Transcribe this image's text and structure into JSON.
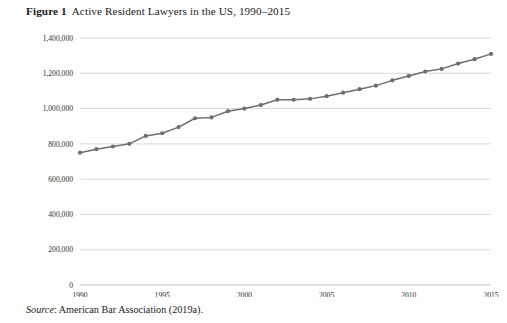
{
  "figure": {
    "number_label": "Figure 1",
    "caption": "Active Resident Lawyers in the US, 1990–2015",
    "source_word": "Source",
    "source_text": ": American Bar Association (2019a).",
    "accent_color": "#6e6e6e",
    "grid_color": "#c9c9c9"
  },
  "chart_data": {
    "type": "line",
    "title": "Active Resident Lawyers in the US, 1990–2015",
    "xlabel": "",
    "ylabel": "",
    "xlim": [
      1990,
      2015
    ],
    "ylim": [
      0,
      1400000
    ],
    "ytick_values": [
      0,
      200000,
      400000,
      600000,
      800000,
      1000000,
      1200000,
      1400000
    ],
    "ytick_labels": [
      "0",
      "200,000",
      "400,000",
      "600,000",
      "800,000",
      "1,000,000",
      "1,200,000",
      "1,400,000"
    ],
    "xtick_values": [
      1990,
      1995,
      2000,
      2005,
      2010,
      2015
    ],
    "xtick_labels": [
      "1990",
      "1995",
      "2000",
      "2005",
      "2010",
      "2015"
    ],
    "grid": "horizontal",
    "legend": "none",
    "markers": true,
    "series": [
      {
        "name": "Active Resident Lawyers",
        "x": [
          1990,
          1991,
          1992,
          1993,
          1994,
          1995,
          1996,
          1997,
          1998,
          1999,
          2000,
          2001,
          2002,
          2003,
          2004,
          2005,
          2006,
          2007,
          2008,
          2009,
          2010,
          2011,
          2012,
          2013,
          2014,
          2015
        ],
        "values": [
          750000,
          770000,
          785000,
          800000,
          845000,
          860000,
          895000,
          945000,
          950000,
          985000,
          1000000,
          1020000,
          1050000,
          1050000,
          1055000,
          1070000,
          1090000,
          1110000,
          1130000,
          1160000,
          1185000,
          1210000,
          1225000,
          1255000,
          1280000,
          1310000
        ]
      }
    ]
  }
}
